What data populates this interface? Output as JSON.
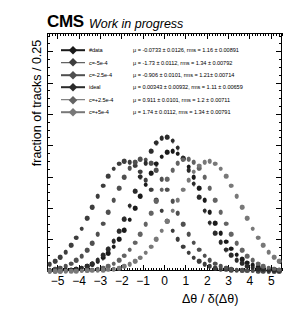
{
  "header": {
    "logo": "CMS",
    "status": "Work in progress"
  },
  "legend": {
    "entries": [
      {
        "label": "#data",
        "stat": "μ = -0.0733 ± 0.0126, rms = 1.16 ± 0.00891",
        "color": "#1a1a1a"
      },
      {
        "label": "c=-5e-4",
        "stat": "μ = -1.73 ± 0.0112, rms = 1.34 ± 0.00792",
        "color": "#3d3d3d"
      },
      {
        "label": "c=-2.5e-4",
        "stat": "μ = -0.906 ± 0.0101, rms = 1.21± 0.00714",
        "color": "#4f4f4f"
      },
      {
        "label": "ideal",
        "stat": "μ = 0.00343 ± 0.00932, rms = 1.11 ± 0.00659",
        "color": "#2b2b2b"
      },
      {
        "label": "c=+2.5e-4",
        "stat": "μ = 0.911 ± 0.0101, rms = 1.2 ± 0.00711",
        "color": "#636363"
      },
      {
        "label": "c=+5e-4",
        "stat": "μ = 1.74 ± 0.0112, rms = 1.34 ± 0.00791",
        "color": "#787878"
      }
    ]
  },
  "chart_data": {
    "type": "scatter",
    "title": "CMS Work in progress",
    "xlabel": "Δθ / δ(Δθ)",
    "ylabel": "fraction of tracks / 0.25",
    "xlim": [
      -5.5,
      5.5
    ],
    "ylim": [
      0.0,
      0.152
    ],
    "xticks": [
      -5,
      -4,
      -3,
      -2,
      -1,
      0,
      1,
      2,
      3,
      4,
      5
    ],
    "yticks": [
      0.0,
      0.02,
      0.04,
      0.06,
      0.08,
      0.1,
      0.12,
      0.14
    ],
    "ytick_labels": [
      "0.00",
      "0.02",
      "0.04",
      "0.06",
      "0.08",
      "0.10",
      "0.12",
      "0.14"
    ],
    "grid": false,
    "legend_position": "upper-left",
    "bin_width": 0.25,
    "x": [
      -5.375,
      -5.125,
      -4.875,
      -4.625,
      -4.375,
      -4.125,
      -3.875,
      -3.625,
      -3.375,
      -3.125,
      -2.875,
      -2.625,
      -2.375,
      -2.125,
      -1.875,
      -1.625,
      -1.375,
      -1.125,
      -0.875,
      -0.625,
      -0.375,
      -0.125,
      0.125,
      0.375,
      0.625,
      0.875,
      1.125,
      1.375,
      1.625,
      1.875,
      2.125,
      2.375,
      2.625,
      2.875,
      3.125,
      3.375,
      3.625,
      3.875,
      4.125,
      4.375,
      4.625,
      4.875,
      5.125,
      5.375
    ],
    "series": [
      {
        "name": "#data",
        "mu": -0.0733,
        "mu_err": 0.0126,
        "rms": 1.16,
        "rms_err": 0.00891,
        "color": "#1a1a1a",
        "amplitude": 0.0845,
        "err": 0.003,
        "values": [
          0.0002,
          0.0003,
          0.0004,
          0.0006,
          0.0009,
          0.0013,
          0.002,
          0.0029,
          0.0042,
          0.006,
          0.0084,
          0.0115,
          0.0155,
          0.0203,
          0.0261,
          0.0327,
          0.04,
          0.0476,
          0.0552,
          0.0623,
          0.0684,
          0.073,
          0.0757,
          0.0764,
          0.075,
          0.0716,
          0.0665,
          0.06,
          0.0527,
          0.0451,
          0.0376,
          0.0306,
          0.0243,
          0.0188,
          0.0142,
          0.0105,
          0.0076,
          0.0053,
          0.0036,
          0.0024,
          0.0016,
          0.001,
          0.0006,
          0.0004
        ]
      },
      {
        "name": "c=-5e-4",
        "mu": -1.73,
        "mu_err": 0.0112,
        "rms": 1.34,
        "rms_err": 0.00792,
        "color": "#3d3d3d",
        "amplitude": 0.0735,
        "err": 0.0028,
        "values": [
          0.0043,
          0.0062,
          0.0088,
          0.0121,
          0.0163,
          0.0213,
          0.0271,
          0.0337,
          0.0407,
          0.0478,
          0.0546,
          0.0606,
          0.0654,
          0.0686,
          0.07,
          0.0695,
          0.0672,
          0.0633,
          0.0581,
          0.052,
          0.0453,
          0.0385,
          0.0319,
          0.0258,
          0.0203,
          0.0156,
          0.0117,
          0.0086,
          0.0061,
          0.0042,
          0.0029,
          0.0019,
          0.0012,
          0.0008,
          0.0005,
          0.0003,
          0.0002,
          0.0001,
          0.0001,
          0.0,
          0.0,
          0.0,
          0.0,
          0.0
        ]
      },
      {
        "name": "c=-2.5e-4",
        "mu": -0.906,
        "mu_err": 0.0101,
        "rms": 1.21,
        "rms_err": 0.00714,
        "color": "#4f4f4f",
        "amplitude": 0.08,
        "err": 0.0029,
        "values": [
          0.0009,
          0.0014,
          0.0021,
          0.0032,
          0.0047,
          0.0068,
          0.0096,
          0.0133,
          0.0179,
          0.0236,
          0.0302,
          0.0375,
          0.0452,
          0.0528,
          0.0598,
          0.0655,
          0.0695,
          0.0714,
          0.0711,
          0.0687,
          0.0644,
          0.0586,
          0.0518,
          0.0444,
          0.037,
          0.03,
          0.0236,
          0.0181,
          0.0135,
          0.0098,
          0.0069,
          0.0047,
          0.0031,
          0.002,
          0.0013,
          0.0008,
          0.0005,
          0.0003,
          0.0002,
          0.0001,
          0.0001,
          0.0,
          0.0,
          0.0
        ]
      },
      {
        "name": "ideal",
        "mu": 0.00343,
        "mu_err": 0.00932,
        "rms": 1.11,
        "rms_err": 0.00659,
        "color": "#2b2b2b",
        "amplitude": 0.094,
        "err": 0.0032,
        "values": [
          0.0001,
          0.0002,
          0.0003,
          0.0005,
          0.0008,
          0.0013,
          0.002,
          0.0031,
          0.0047,
          0.0069,
          0.0099,
          0.0139,
          0.0191,
          0.0255,
          0.0331,
          0.0417,
          0.051,
          0.0603,
          0.069,
          0.0765,
          0.082,
          0.085,
          0.0855,
          0.0833,
          0.0787,
          0.0722,
          0.0644,
          0.0558,
          0.047,
          0.0386,
          0.0309,
          0.0241,
          0.0184,
          0.0137,
          0.0099,
          0.007,
          0.0048,
          0.0032,
          0.0021,
          0.0013,
          0.0008,
          0.0005,
          0.0003,
          0.0002
        ]
      },
      {
        "name": "c=+2.5e-4",
        "mu": 0.911,
        "mu_err": 0.0101,
        "rms": 1.2,
        "rms_err": 0.00711,
        "color": "#636363",
        "amplitude": 0.08,
        "err": 0.0029,
        "values": [
          0.0,
          0.0,
          0.0,
          0.0001,
          0.0001,
          0.0002,
          0.0003,
          0.0005,
          0.0008,
          0.0013,
          0.002,
          0.0031,
          0.0047,
          0.0069,
          0.0098,
          0.0135,
          0.0181,
          0.0236,
          0.03,
          0.037,
          0.0444,
          0.0518,
          0.0586,
          0.0644,
          0.0687,
          0.0711,
          0.0714,
          0.0695,
          0.0655,
          0.0598,
          0.0528,
          0.0452,
          0.0375,
          0.0302,
          0.0236,
          0.0179,
          0.0133,
          0.0096,
          0.0068,
          0.0047,
          0.0032,
          0.0021,
          0.0014,
          0.0009
        ]
      },
      {
        "name": "c=+5e-4",
        "mu": 1.74,
        "mu_err": 0.0112,
        "rms": 1.34,
        "rms_err": 0.00791,
        "color": "#787878",
        "amplitude": 0.0735,
        "err": 0.0028,
        "values": [
          0.0,
          0.0,
          0.0,
          0.0,
          0.0,
          0.0,
          0.0001,
          0.0001,
          0.0002,
          0.0003,
          0.0005,
          0.0008,
          0.0012,
          0.0019,
          0.0029,
          0.0042,
          0.0061,
          0.0086,
          0.0117,
          0.0156,
          0.0203,
          0.0258,
          0.0319,
          0.0385,
          0.0453,
          0.052,
          0.0581,
          0.0633,
          0.0672,
          0.0695,
          0.07,
          0.0686,
          0.0654,
          0.0606,
          0.0546,
          0.0478,
          0.0407,
          0.0337,
          0.0271,
          0.0213,
          0.0163,
          0.0121,
          0.0088,
          0.0062
        ]
      }
    ]
  }
}
